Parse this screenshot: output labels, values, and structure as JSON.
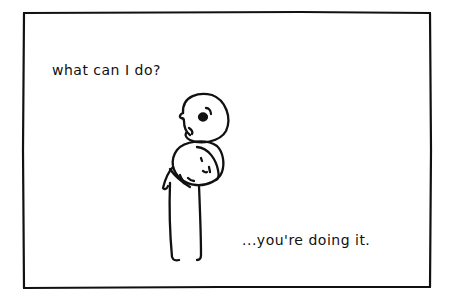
{
  "comic": {
    "caption_top": "what can I do?",
    "caption_bottom": "...you're doing it.",
    "ink_color": "#111111",
    "paper_color": "#ffffff"
  }
}
